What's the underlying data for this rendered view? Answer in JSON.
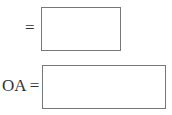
{
  "fields": [
    {
      "label": "=",
      "value": ""
    },
    {
      "label": "OA =",
      "value": ""
    }
  ]
}
